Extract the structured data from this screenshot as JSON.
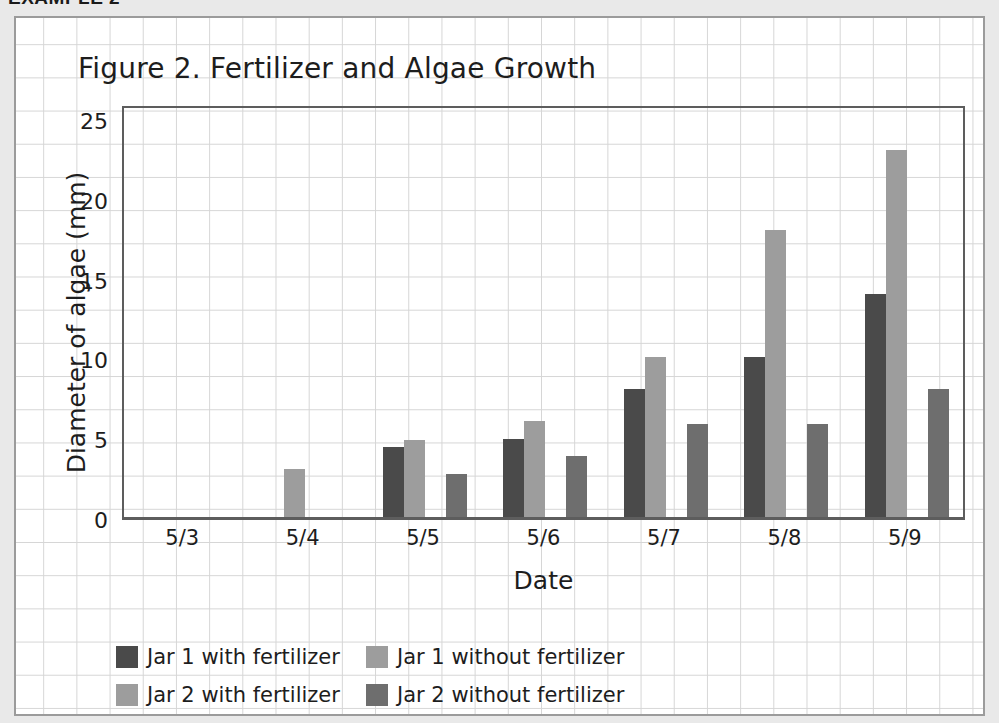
{
  "page": {
    "cut_heading": "EXAMPLE 2"
  },
  "chart_data": {
    "type": "bar",
    "title": "Figure 2. Fertilizer and Algae Growth",
    "xlabel": "Date",
    "ylabel": "Diameter of algae (mm)",
    "categories": [
      "5/3",
      "5/4",
      "5/5",
      "5/6",
      "5/7",
      "5/8",
      "5/9"
    ],
    "ylim": [
      0,
      25
    ],
    "yticks": [
      0,
      5,
      10,
      15,
      20,
      25
    ],
    "grid": true,
    "legend_position": "bottom-left",
    "series": [
      {
        "name": "Jar 1 with fertilizer",
        "color": "#4a4a4a",
        "values": [
          0,
          0,
          4.4,
          4.9,
          8,
          10,
          14
        ]
      },
      {
        "name": "Jar 1 without fertilizer",
        "color": "#9d9d9d",
        "values": [
          0,
          3,
          4.8,
          6,
          10,
          18,
          23
        ]
      },
      {
        "name": "Jar 2 with fertilizer",
        "color": "#9d9d9d",
        "values": [
          0,
          0,
          0,
          0,
          0,
          0,
          0
        ]
      },
      {
        "name": "Jar 2 without fertilizer",
        "color": "#6e6e6e",
        "values": [
          0,
          0,
          2.7,
          3.8,
          5.8,
          5.8,
          8
        ]
      }
    ]
  }
}
